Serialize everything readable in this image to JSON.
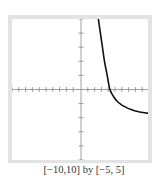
{
  "chart_data": {
    "type": "line",
    "title": "",
    "xlabel": "",
    "ylabel": "",
    "xlim": [
      -10,
      10
    ],
    "ylim": [
      -5,
      5
    ],
    "xscale": 1,
    "yscale": 1,
    "grid": false,
    "axes_visible": true,
    "tick_marks": {
      "x": [
        -10,
        -9,
        -8,
        -7,
        -6,
        -5,
        -4,
        -3,
        -2,
        -1,
        1,
        2,
        3,
        4,
        5,
        6,
        7,
        8,
        9,
        10
      ],
      "y": [
        -5,
        -4,
        -3,
        -2,
        -1,
        1,
        2,
        3,
        4,
        5
      ]
    },
    "caption": "[−10,10] by [−5, 5]",
    "series": [
      {
        "name": "curve",
        "color": "#111111",
        "x": [
          2.7,
          3.0,
          3.3,
          3.6,
          4.0,
          4.4,
          5.0,
          5.5,
          6.0,
          6.5,
          7.0,
          7.5,
          8.0,
          8.5,
          9.0,
          9.5,
          10.0
        ],
        "y": [
          5.0,
          4.0,
          3.0,
          2.0,
          1.0,
          0.0,
          -0.55,
          -0.85,
          -1.05,
          -1.2,
          -1.32,
          -1.42,
          -1.5,
          -1.56,
          -1.61,
          -1.65,
          -1.68
        ]
      }
    ]
  },
  "caption": {
    "text": "[−10,10] by [−5, 5]"
  },
  "colors": {
    "frame": "#e3e3e3",
    "axis": "#888888",
    "curve": "#111111",
    "background": "#ffffff"
  }
}
